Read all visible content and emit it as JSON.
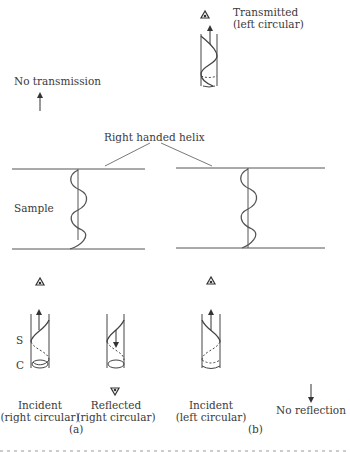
{
  "labels": {
    "transmitted_line1": "Transmitted",
    "transmitted_line2": "(left circular)",
    "no_transmission": "No transmission",
    "right_handed_helix": "Right handed helix",
    "sample": "Sample",
    "s_label": "S",
    "c_label": "C",
    "incident_a_line1": "Incident",
    "incident_a_line2": "(right circular)",
    "reflected_line1": "Reflected",
    "reflected_line2": "(right circular)",
    "incident_b_line1": "Incident",
    "incident_b_line2": "(left circular)",
    "no_reflection": "No reflection",
    "panel_a": "(a)",
    "panel_b": "(b)"
  },
  "colors": {
    "ink": "#3a3a3a",
    "line": "#555555",
    "background": "#ffffff"
  }
}
